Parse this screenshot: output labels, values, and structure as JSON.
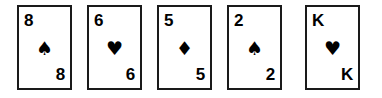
{
  "scene": {
    "title": "Playing card hand",
    "background_color": "#ffffff",
    "border_color": "#1a1a1a",
    "ink_color": "#000000",
    "card_count": 5
  },
  "cards": [
    {
      "id": "card-1",
      "rank": "8",
      "suit_name": "spades",
      "suit_glyph": "♠",
      "suit_color": "#000000",
      "label": "8 of spades"
    },
    {
      "id": "card-2",
      "rank": "6",
      "suit_name": "hearts",
      "suit_glyph": "♥",
      "suit_color": "#000000",
      "label": "6 of hearts"
    },
    {
      "id": "card-3",
      "rank": "5",
      "suit_name": "diamonds",
      "suit_glyph": "♦",
      "suit_color": "#000000",
      "label": "5 of diamonds"
    },
    {
      "id": "card-4",
      "rank": "2",
      "suit_name": "spades",
      "suit_glyph": "♠",
      "suit_color": "#000000",
      "label": "2 of spades"
    },
    {
      "id": "card-5",
      "rank": "K",
      "suit_name": "hearts",
      "suit_glyph": "♥",
      "suit_color": "#000000",
      "label": "K of hearts"
    }
  ]
}
